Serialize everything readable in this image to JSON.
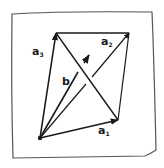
{
  "diagram": {
    "type": "vector-parallelogram-sketch",
    "style": "hand-drawn",
    "colors": {
      "ink": "#1a1a1a",
      "paper": "#ffffff",
      "frame": "#555555"
    },
    "points": {
      "origin": [
        40,
        138
      ],
      "a1_tip": [
        118,
        120
      ],
      "a3_tip": [
        56,
        33
      ],
      "a2_tip": [
        129,
        33
      ],
      "b_tip": [
        78,
        72
      ]
    },
    "labels": {
      "a1": "a",
      "a1_sub": "1",
      "a2": "a",
      "a2_sub": "2",
      "a3": "a",
      "a3_sub": "3",
      "b": "b"
    }
  }
}
